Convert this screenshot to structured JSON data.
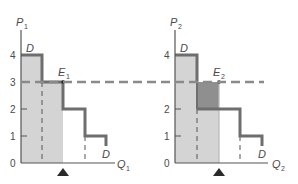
{
  "colors": {
    "background": "#ffffff",
    "axis": "#555555",
    "demand_line": "#6e6e6e",
    "light_shade": "#d4d4d4",
    "dark_shade": "#8f8f8f",
    "dashed_price_line": "#8a8a8a",
    "text": "#4a4a4a",
    "marker": "#2a2a2a"
  },
  "left_panel": {
    "y_axis_label": "P",
    "y_axis_sub": "1",
    "x_axis_label": "Q",
    "x_axis_sub": "1",
    "y_ticks": [
      "0",
      "1",
      "2",
      "3",
      "4"
    ],
    "demand_label_top": "D",
    "demand_label_bottom": "D",
    "equilibrium_label": "E",
    "equilibrium_sub": "1"
  },
  "right_panel": {
    "y_axis_label": "P",
    "y_axis_sub": "2",
    "x_axis_label": "Q",
    "x_axis_sub": "2",
    "y_ticks": [
      "0",
      "1",
      "2",
      "4"
    ],
    "demand_label_top": "D",
    "demand_label_bottom": "D",
    "equilibrium_label": "E",
    "equilibrium_sub": "2"
  },
  "shared": {
    "price_line_value": "3"
  }
}
